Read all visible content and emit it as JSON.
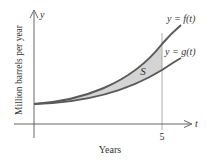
{
  "diagram": {
    "type": "area-between-curves",
    "axes": {
      "x_variable": "t",
      "y_variable": "y",
      "x_label": "Years",
      "y_label": "Million barrels per year",
      "x_tick": "5"
    },
    "curves": [
      {
        "name": "f",
        "label": "y = f(t)",
        "position": "upper"
      },
      {
        "name": "g",
        "label": "y = g(t)",
        "position": "lower"
      }
    ],
    "region_label": "S",
    "colors": {
      "curve": "#555555",
      "region_fill": "#d4d4d4",
      "axis": "#555555",
      "text": "#333333"
    }
  }
}
